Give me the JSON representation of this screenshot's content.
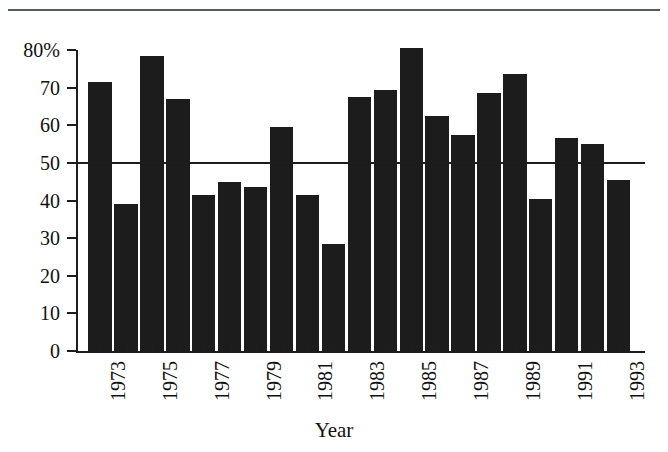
{
  "chart_data": {
    "type": "bar",
    "title": "",
    "subtitle": "",
    "xlabel": "Year",
    "ylabel": "",
    "ylim": [
      0,
      80
    ],
    "y_unit": "%",
    "grid": false,
    "legend": null,
    "categories": [
      "1973",
      "1974",
      "1975",
      "1976",
      "1977",
      "1978",
      "1979",
      "1980",
      "1981",
      "1982",
      "1983",
      "1984",
      "1985",
      "1986",
      "1987",
      "1988",
      "1989",
      "1990",
      "1991",
      "1992",
      "1993"
    ],
    "values": [
      71.5,
      39,
      78.5,
      67,
      41.5,
      45,
      43.5,
      59.5,
      41.5,
      28.5,
      67.5,
      69.5,
      80.5,
      62.5,
      57.5,
      68.5,
      73.5,
      40.5,
      56.5,
      55,
      45.5
    ],
    "y_ticks": [
      {
        "value": 80,
        "label": "80%"
      },
      {
        "value": 70,
        "label": "70"
      },
      {
        "value": 60,
        "label": "60"
      },
      {
        "value": 50,
        "label": "50"
      },
      {
        "value": 40,
        "label": "40"
      },
      {
        "value": 30,
        "label": "30"
      },
      {
        "value": 20,
        "label": "20"
      },
      {
        "value": 10,
        "label": "10"
      },
      {
        "value": 0,
        "label": "0"
      }
    ],
    "x_tick_labels": [
      "1973",
      "1975",
      "1977",
      "1979",
      "1981",
      "1983",
      "1985",
      "1987",
      "1989",
      "1991",
      "1993"
    ],
    "annotations": [
      {
        "type": "reference-line",
        "orientation": "horizontal",
        "value": 50
      }
    ],
    "bar_color": "#1c1c1c",
    "axis_color": "#1d1d1d",
    "background_color": "#ffffff"
  },
  "axis": {
    "x_title": "Year"
  }
}
